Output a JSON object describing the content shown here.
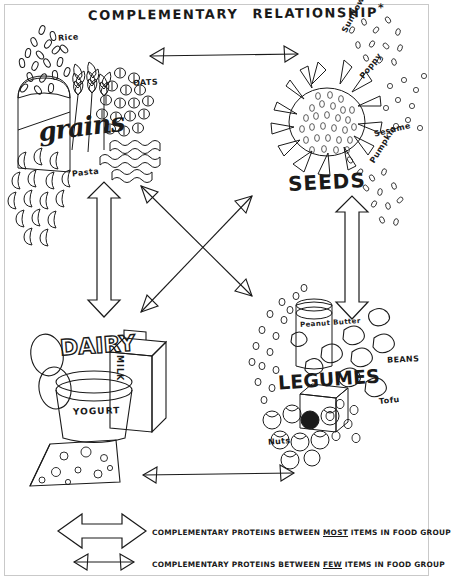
{
  "title": {
    "part1": "COMPLEMENTARY",
    "part2": "RELATIONSHIP",
    "asterisk": "*"
  },
  "groups": {
    "grains": {
      "heading": "grains",
      "items": [
        {
          "label": "Rice"
        },
        {
          "label": "OATS"
        },
        {
          "label": "Pasta"
        }
      ],
      "icons": [
        "bread-loaf-icon",
        "wheat-stalk-icon",
        "oat-grain-icon",
        "pasta-noodle-icon",
        "rice-grain-icon"
      ]
    },
    "seeds": {
      "heading": "SEEDS",
      "items": [
        {
          "label": "Sunflower"
        },
        {
          "label": "Poppy"
        },
        {
          "label": "Sesame"
        },
        {
          "label": "Pumpkin"
        }
      ],
      "icons": [
        "sunflower-head-icon",
        "seed-scatter-icon"
      ]
    },
    "dairy": {
      "heading": "DAIRY",
      "items": [
        {
          "label": "MILK"
        },
        {
          "label": "YOGURT"
        }
      ],
      "icons": [
        "egg-icon",
        "milk-carton-icon",
        "yogurt-tub-icon",
        "cheese-wedge-icon"
      ]
    },
    "legumes": {
      "heading": "LEGUMES",
      "items": [
        {
          "label": "Peanut Butter"
        },
        {
          "label": "BEANS"
        },
        {
          "label": "Tofu"
        },
        {
          "label": "Nuts"
        }
      ],
      "icons": [
        "peanut-butter-jar-icon",
        "bean-icon",
        "tofu-cube-icon",
        "nut-icon",
        "lentil-icon"
      ]
    }
  },
  "connections": [
    {
      "from": "grains",
      "to": "seeds",
      "strength": "few",
      "orientation": "horizontal-top"
    },
    {
      "from": "grains",
      "to": "dairy",
      "strength": "most",
      "orientation": "vertical-left"
    },
    {
      "from": "seeds",
      "to": "legumes",
      "strength": "most",
      "orientation": "vertical-right"
    },
    {
      "from": "dairy",
      "to": "legumes",
      "strength": "few",
      "orientation": "horizontal-bottom"
    },
    {
      "from": "grains",
      "to": "legumes",
      "strength": "few",
      "orientation": "diagonal-down-right"
    },
    {
      "from": "dairy",
      "to": "seeds",
      "strength": "few",
      "orientation": "diagonal-up-right"
    }
  ],
  "legend": [
    {
      "arrow": "thick-double-arrow",
      "pre": "COMPLEMENTARY PROTEINS BETWEEN ",
      "emphasis": "MOST",
      "post": " ITEMS IN FOOD GROUP"
    },
    {
      "arrow": "thin-double-arrow",
      "pre": "COMPLEMENTARY PROTEINS BETWEEN ",
      "emphasis": "FEW",
      "post": " ITEMS IN FOOD GROUP"
    }
  ],
  "colors": {
    "ink": "#1a1a1a",
    "paper": "#ffffff",
    "frame": "#c9c9c9"
  }
}
